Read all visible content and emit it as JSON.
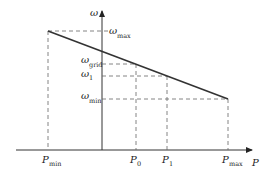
{
  "diagram": {
    "type": "droop-characteristic",
    "y_axis": {
      "symbol": "ω"
    },
    "x_axis": {
      "symbol": "P"
    },
    "y_labels": [
      {
        "base": "ω",
        "sub": "max"
      },
      {
        "base": "ω",
        "sub": "grid"
      },
      {
        "base": "ω",
        "sub": "1"
      },
      {
        "base": "ω",
        "sub": "min"
      }
    ],
    "x_labels": [
      {
        "base": "P",
        "sub": "min"
      },
      {
        "base": "P",
        "sub": "0"
      },
      {
        "base": "P",
        "sub": "1"
      },
      {
        "base": "P",
        "sub": "max"
      }
    ],
    "colors": {
      "line": "#333333",
      "axis": "#333333",
      "dashed": "#666666",
      "background": "#ffffff"
    }
  }
}
